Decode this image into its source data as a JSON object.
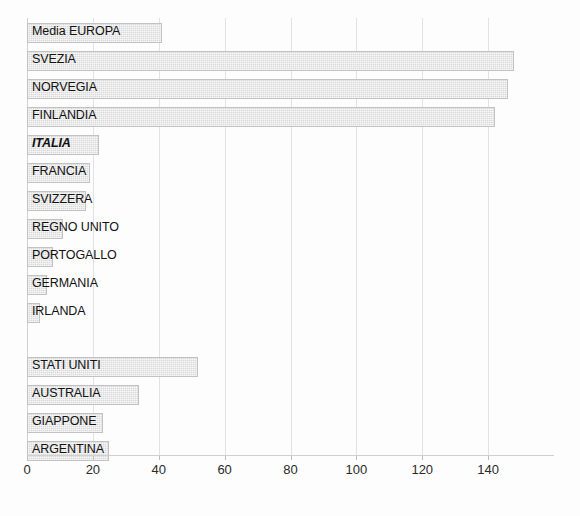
{
  "chart_data": {
    "type": "bar",
    "orientation": "horizontal",
    "title": "",
    "subtitle": "",
    "xlabel": "",
    "ylabel": "",
    "xlim": [
      0,
      160
    ],
    "ylim": null,
    "grid": true,
    "legend": null,
    "legend_position": "none",
    "xticks": [
      0,
      20,
      40,
      60,
      80,
      100,
      120,
      140
    ],
    "xticklabels": [
      "0",
      "20",
      "40",
      "60",
      "80",
      "100",
      "120",
      "140"
    ],
    "categories": [
      "Media EUROPA",
      "SVEZIA",
      "NORVEGIA",
      "FINLANDIA",
      "ITALIA",
      "FRANCIA",
      "SVIZZERA",
      "REGNO UNITO",
      "PORTOGALLO",
      "GERMANIA",
      "IRLANDA",
      "STATI UNITI",
      "AUSTRALIA",
      "GIAPPONE",
      "ARGENTINA"
    ],
    "values": [
      41,
      148,
      146,
      142,
      22,
      19,
      18,
      11,
      8,
      6,
      4,
      52,
      34,
      23,
      25
    ],
    "highlighted_category": "ITALIA",
    "bar_color": "#d9d9d9",
    "bar_border_color": "#c2c2c2",
    "grid_color": "#e2e2e2",
    "text_color": "#111111",
    "background_color": "#fdfdfd"
  },
  "axis": {
    "x_min": 0,
    "x_max": 160,
    "tick_step": 20
  },
  "rows": [
    {
      "label": "Media EUROPA",
      "value": 41,
      "highlight": false,
      "gap_before": false
    },
    {
      "label": "SVEZIA",
      "value": 148,
      "highlight": false,
      "gap_before": false
    },
    {
      "label": "NORVEGIA",
      "value": 146,
      "highlight": false,
      "gap_before": false
    },
    {
      "label": "FINLANDIA",
      "value": 142,
      "highlight": false,
      "gap_before": false
    },
    {
      "label": "ITALIA",
      "value": 22,
      "highlight": true,
      "gap_before": false
    },
    {
      "label": "FRANCIA",
      "value": 19,
      "highlight": false,
      "gap_before": false
    },
    {
      "label": "SVIZZERA",
      "value": 18,
      "highlight": false,
      "gap_before": false
    },
    {
      "label": "REGNO UNITO",
      "value": 11,
      "highlight": false,
      "gap_before": false
    },
    {
      "label": "PORTOGALLO",
      "value": 8,
      "highlight": false,
      "gap_before": false
    },
    {
      "label": "GERMANIA",
      "value": 6,
      "highlight": false,
      "gap_before": false
    },
    {
      "label": "IRLANDA",
      "value": 4,
      "highlight": false,
      "gap_before": false
    },
    {
      "label": "STATI UNITI",
      "value": 52,
      "highlight": false,
      "gap_before": true
    },
    {
      "label": "AUSTRALIA",
      "value": 34,
      "highlight": false,
      "gap_before": false
    },
    {
      "label": "GIAPPONE",
      "value": 23,
      "highlight": false,
      "gap_before": false
    },
    {
      "label": "ARGENTINA",
      "value": 25,
      "highlight": false,
      "gap_before": false
    }
  ]
}
